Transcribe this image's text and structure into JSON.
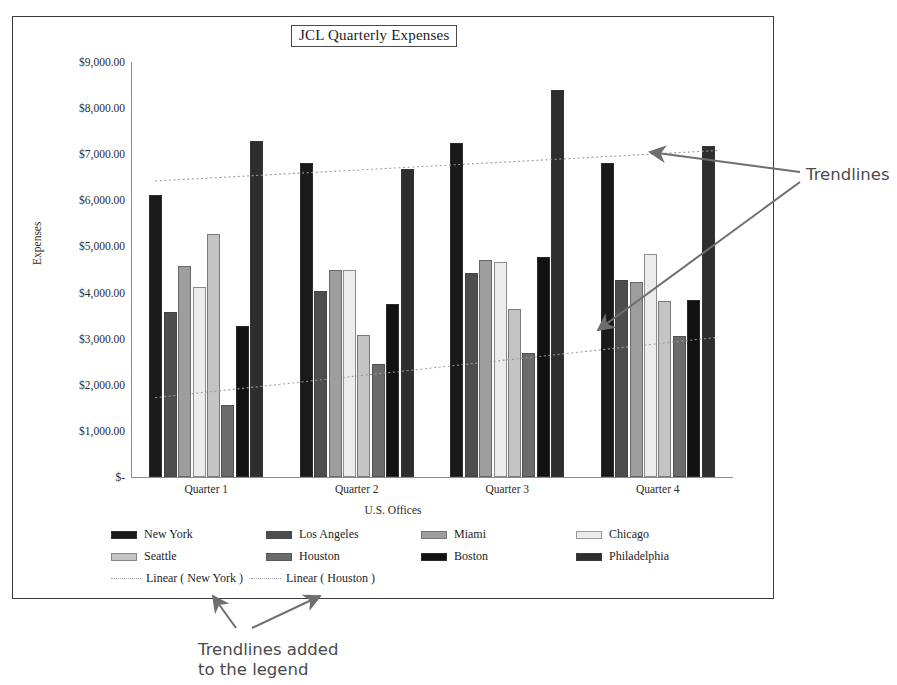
{
  "chart": {
    "title": "JCL Quarterly Expenses",
    "x_axis_title": "U.S. Offices",
    "y_axis_title": "Expenses"
  },
  "annotations": {
    "trendlines_label": "Trendlines",
    "legend_label": "Trendlines added\nto the legend"
  },
  "legend": {
    "row1": [
      {
        "label": "New York",
        "color": "#1a1a1a"
      },
      {
        "label": "Los Angeles",
        "color": "#4d4d4d"
      },
      {
        "label": "Miami",
        "color": "#9e9e9e"
      },
      {
        "label": "Chicago",
        "color": "#ececec"
      }
    ],
    "row2": [
      {
        "label": "Seattle",
        "color": "#c4c4c4"
      },
      {
        "label": "Houston",
        "color": "#6b6b6b"
      },
      {
        "label": "Boston",
        "color": "#121212"
      },
      {
        "label": "Philadelphia",
        "color": "#2e2e2e"
      }
    ],
    "trendlines": [
      {
        "label": "Linear ( New York )",
        "color": "#9b9b9b"
      },
      {
        "label": "Linear ( Houston )",
        "color": "#9b9b9b"
      }
    ]
  },
  "chart_data": {
    "type": "bar",
    "title": "JCL Quarterly Expenses",
    "xlabel": "U.S. Offices",
    "ylabel": "Expenses",
    "grid": false,
    "legend_position": "bottom",
    "ylim": [
      0,
      9000
    ],
    "ytick_labels": [
      "$9,000.00",
      "$8,000.00",
      "$7,000.00",
      "$6,000.00",
      "$5,000.00",
      "$4,000.00",
      "$3,000.00",
      "$2,000.00",
      "$1,000.00",
      "$-"
    ],
    "ytick_values": [
      9000,
      8000,
      7000,
      6000,
      5000,
      4000,
      3000,
      2000,
      1000,
      0
    ],
    "categories": [
      "Quarter 1",
      "Quarter 2",
      "Quarter 3",
      "Quarter 4"
    ],
    "series": [
      {
        "name": "New York",
        "color": "#1a1a1a",
        "values": [
          6120,
          6800,
          7250,
          6800
        ]
      },
      {
        "name": "Los Angeles",
        "color": "#4d4d4d",
        "values": [
          3580,
          4030,
          4420,
          4280
        ]
      },
      {
        "name": "Miami",
        "color": "#9e9e9e",
        "values": [
          4580,
          4480,
          4700,
          4230
        ]
      },
      {
        "name": "Chicago",
        "color": "#ececec",
        "values": [
          4130,
          4480,
          4660,
          4830
        ]
      },
      {
        "name": "Seattle",
        "color": "#c4c4c4",
        "values": [
          5280,
          3080,
          3650,
          3820
        ]
      },
      {
        "name": "Houston",
        "color": "#6b6b6b",
        "values": [
          1560,
          2450,
          2700,
          3050
        ]
      },
      {
        "name": "Boston",
        "color": "#121212",
        "values": [
          3280,
          3760,
          4780,
          3830
        ]
      },
      {
        "name": "Philadelphia",
        "color": "#2e2e2e",
        "values": [
          7280,
          6670,
          8400,
          7180
        ]
      }
    ],
    "trendlines": [
      {
        "name": "Linear ( New York )",
        "color": "#9b9b9b",
        "start": 6420,
        "end": 7080
      },
      {
        "name": "Linear ( Houston )",
        "color": "#9b9b9b",
        "start": 1720,
        "end": 3030
      }
    ]
  }
}
